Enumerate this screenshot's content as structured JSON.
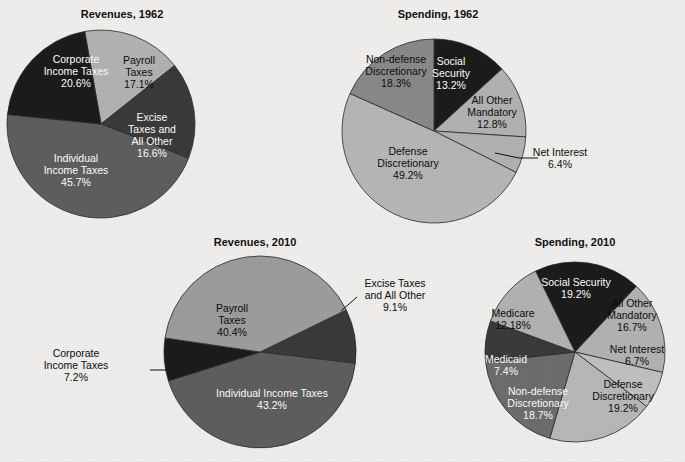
{
  "page": {
    "background_color": "#f1f0ee",
    "width": 685,
    "height": 462
  },
  "palette": {
    "black": "#1c1c1c",
    "dark_gray": "#3b3b3b",
    "mid_gray": "#5f5f5f",
    "gray": "#8a8a8a",
    "light_gray": "#b3b3b3",
    "pale_gray": "#c9c9c9",
    "outline": "#2b2b2b",
    "label_light": "#ffffff",
    "label_dark": "#0d0d0d"
  },
  "charts": [
    {
      "id": "revenues-1962",
      "title": "Revenues, 1962",
      "title_x": 122,
      "title_y": 18,
      "cx": 101,
      "cy": 124,
      "r": 94,
      "start_angle": -10,
      "slices": [
        {
          "label": "Payroll Taxes",
          "label_lines": [
            "Payroll",
            "Taxes",
            "17.1%"
          ],
          "value": 17.1,
          "color": "#b3b3b3",
          "text_color": "#0d0d0d",
          "label_x": 139,
          "label_y": 64,
          "external": false
        },
        {
          "label": "Excise Taxes and All Other",
          "label_lines": [
            "Excise",
            "Taxes and",
            "All Other",
            "16.6%"
          ],
          "value": 16.6,
          "color": "#3b3b3b",
          "text_color": "#ffffff",
          "label_x": 152,
          "label_y": 121,
          "external": false
        },
        {
          "label": "Individual Income Taxes",
          "label_lines": [
            "Individual",
            "Income Taxes",
            "45.7%"
          ],
          "value": 45.7,
          "color": "#5f5f5f",
          "text_color": "#ffffff",
          "label_x": 76,
          "label_y": 162,
          "external": false
        },
        {
          "label": "Corporate Income Taxes",
          "label_lines": [
            "Corporate",
            "Income Taxes",
            "20.6%"
          ],
          "value": 20.6,
          "color": "#1c1c1c",
          "text_color": "#ffffff",
          "label_x": 76,
          "label_y": 63,
          "external": false
        }
      ]
    },
    {
      "id": "spending-1962",
      "title": "Spending, 1962",
      "title_x": 438,
      "title_y": 18,
      "cx": 434,
      "cy": 131,
      "r": 92,
      "start_angle": 0,
      "slices": [
        {
          "label": "Social Security",
          "label_lines": [
            "Social",
            "Security",
            "13.2%"
          ],
          "value": 13.2,
          "color": "#1c1c1c",
          "text_color": "#ffffff",
          "label_x": 451,
          "label_y": 65,
          "external": false
        },
        {
          "label": "All Other Mandatory",
          "label_lines": [
            "All Other",
            "Mandatory",
            "12.8%"
          ],
          "value": 12.8,
          "color": "#b3b3b3",
          "text_color": "#0d0d0d",
          "label_x": 492,
          "label_y": 104,
          "external": false
        },
        {
          "label": "Net Interest",
          "label_lines": [
            "Net Interest",
            "6.4%"
          ],
          "value": 6.4,
          "color": "#b3b3b3",
          "text_color": "#0d0d0d",
          "label_x": 560,
          "label_y": 156,
          "external": true,
          "leader": [
            [
              495,
              153
            ],
            [
              519,
              158
            ],
            [
              538,
              158
            ]
          ]
        },
        {
          "label": "Defense Discretionary",
          "label_lines": [
            "Defense",
            "Discretionary",
            "49.2%"
          ],
          "value": 49.2,
          "color": "#b8b8b8",
          "text_color": "#0d0d0d",
          "label_x": 408,
          "label_y": 155,
          "external": false
        },
        {
          "label": "Non-defense Discretionary",
          "label_lines": [
            "Non-defense",
            "Discretionary",
            "18.3%"
          ],
          "value": 18.3,
          "color": "#8a8a8a",
          "text_color": "#0d0d0d",
          "label_x": 396,
          "label_y": 63,
          "external": false
        }
      ]
    },
    {
      "id": "revenues-2010",
      "title": "Revenues, 2010",
      "title_x": 255,
      "title_y": 246,
      "cx": 260,
      "cy": 352,
      "r": 96,
      "start_angle": 64,
      "slices": [
        {
          "label": "Excise Taxes and All Other",
          "label_lines": [
            "Excise Taxes",
            "and All Other",
            "9.1%"
          ],
          "value": 9.1,
          "color": "#3b3b3b",
          "text_color": "#0d0d0d",
          "label_x": 395,
          "label_y": 287,
          "external": true,
          "leader": [
            [
              341,
              311
            ],
            [
              357,
              297
            ]
          ]
        },
        {
          "label": "Individual Income Taxes",
          "label_lines": [
            "Individual Income Taxes",
            "43.2%"
          ],
          "value": 43.2,
          "color": "#5f5f5f",
          "text_color": "#ffffff",
          "label_x": 272,
          "label_y": 397,
          "external": false
        },
        {
          "label": "Corporate Income Taxes",
          "label_lines": [
            "Corporate",
            "Income Taxes",
            "7.2%"
          ],
          "value": 7.2,
          "color": "#1c1c1c",
          "text_color": "#0d0d0d",
          "label_x": 76,
          "label_y": 357,
          "external": true,
          "leader": [
            [
              172,
              370
            ],
            [
              150,
              370
            ]
          ]
        },
        {
          "label": "Payroll Taxes",
          "label_lines": [
            "Payroll",
            "Taxes",
            "40.4%"
          ],
          "value": 40.4,
          "color": "#9e9e9e",
          "text_color": "#0d0d0d",
          "label_x": 232,
          "label_y": 312,
          "external": false
        }
      ]
    },
    {
      "id": "spending-2010",
      "title": "Spending, 2010",
      "title_x": 575,
      "title_y": 246,
      "cx": 575,
      "cy": 352,
      "r": 90,
      "start_angle": -26,
      "slices": [
        {
          "label": "Social Security",
          "label_lines": [
            "Social Security",
            "19.2%"
          ],
          "value": 19.2,
          "color": "#1c1c1c",
          "text_color": "#ffffff",
          "label_x": 576,
          "label_y": 286,
          "external": false
        },
        {
          "label": "All Other Mandatory",
          "label_lines": [
            "All Other",
            "Mandatory",
            "16.7%"
          ],
          "value": 16.7,
          "color": "#b3b3b3",
          "text_color": "#0d0d0d",
          "label_x": 632,
          "label_y": 307,
          "external": false
        },
        {
          "label": "Net Interest",
          "label_lines": [
            "Net Interest",
            "6.7%"
          ],
          "value": 6.7,
          "color": "#c2c2c2",
          "text_color": "#0d0d0d",
          "label_x": 637,
          "label_y": 353,
          "external": false
        },
        {
          "label": "Defense Discretionary",
          "label_lines": [
            "Defense",
            "Discretionary",
            "19.2%"
          ],
          "value": 19.2,
          "color": "#b9b9b9",
          "text_color": "#0d0d0d",
          "label_x": 623,
          "label_y": 388,
          "external": false
        },
        {
          "label": "Non-defense Discretionary",
          "label_lines": [
            "Non-defense",
            "Discretionary",
            "18.7%"
          ],
          "value": 18.7,
          "color": "#6e6e6e",
          "text_color": "#ffffff",
          "label_x": 538,
          "label_y": 395,
          "external": false
        },
        {
          "label": "Medicaid",
          "label_lines": [
            "Medicaid",
            "7.4%"
          ],
          "value": 7.4,
          "color": "#3b3b3b",
          "text_color": "#ffffff",
          "label_x": 506,
          "label_y": 363,
          "external": false
        },
        {
          "label": "Medicare",
          "label_lines": [
            "Medicare",
            "12.18%"
          ],
          "value": 12.18,
          "color": "#b3b3b3",
          "text_color": "#0d0d0d",
          "label_x": 513,
          "label_y": 317,
          "external": false
        }
      ]
    }
  ]
}
